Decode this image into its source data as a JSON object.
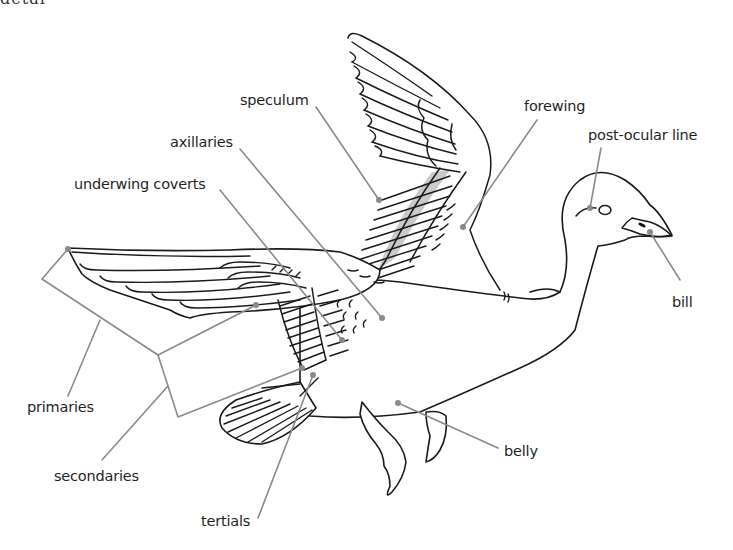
{
  "page": {
    "title_fragment": "detail"
  },
  "labels": [
    {
      "id": "speculum",
      "text": "speculum",
      "x": 240,
      "y": 113
    },
    {
      "id": "axillaries",
      "text": "axillaries",
      "x": 170,
      "y": 135
    },
    {
      "id": "underwing-coverts",
      "text": "underwing coverts",
      "x": 74,
      "y": 177
    },
    {
      "id": "forewing",
      "text": "forewing",
      "x": 524,
      "y": 99
    },
    {
      "id": "post-ocular-line",
      "text": "post-ocular line",
      "x": 588,
      "y": 128
    },
    {
      "id": "bill",
      "text": "bill",
      "x": 672,
      "y": 295
    },
    {
      "id": "primaries",
      "text": "primaries",
      "x": 27,
      "y": 399
    },
    {
      "id": "secondaries",
      "text": "secondaries",
      "x": 54,
      "y": 468
    },
    {
      "id": "belly",
      "text": "belly",
      "x": 504,
      "y": 444
    },
    {
      "id": "tertials",
      "text": "tertials",
      "x": 201,
      "y": 514
    }
  ],
  "colors": {
    "line": "#1a1a1a",
    "leader": "#8a8a8a",
    "speculum_fill": "#c9c9c9",
    "text": "#1f1f1f",
    "background": "#ffffff"
  }
}
